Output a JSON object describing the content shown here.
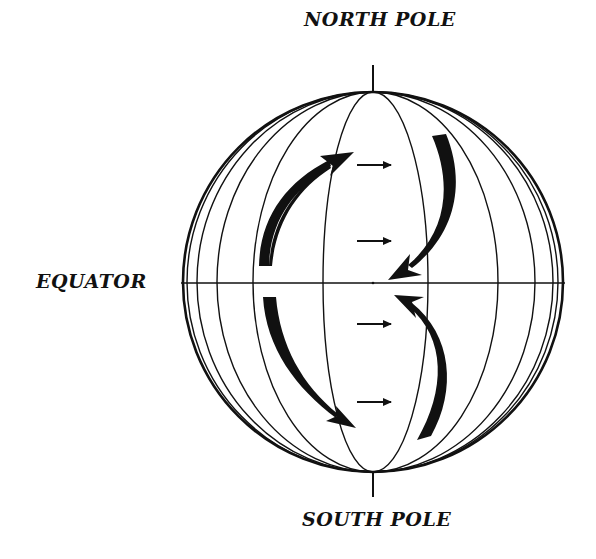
{
  "diagram": {
    "labels": {
      "north_pole": "NORTH POLE",
      "south_pole": "SOUTH POLE",
      "equator": "EQUATOR"
    },
    "globe": {
      "cx": 373,
      "cy": 282,
      "r": 190,
      "stroke": "#111111"
    },
    "meridian_rx": [
      50,
      55,
      120,
      125,
      156,
      162,
      176,
      180,
      186,
      190
    ],
    "straight_arrows": [
      {
        "hemisphere": "north",
        "y": 164,
        "direction": "east"
      },
      {
        "hemisphere": "north",
        "y": 241,
        "direction": "east"
      },
      {
        "hemisphere": "south",
        "y": 323,
        "direction": "east"
      },
      {
        "hemisphere": "south",
        "y": 402,
        "direction": "east"
      }
    ],
    "curved_arrows": [
      {
        "position": "north-west",
        "direction": "up toward north-east"
      },
      {
        "position": "north-east",
        "direction": "down toward equator"
      },
      {
        "position": "south-west",
        "direction": "down toward south-east"
      },
      {
        "position": "south-east",
        "direction": "up toward equator"
      }
    ]
  }
}
